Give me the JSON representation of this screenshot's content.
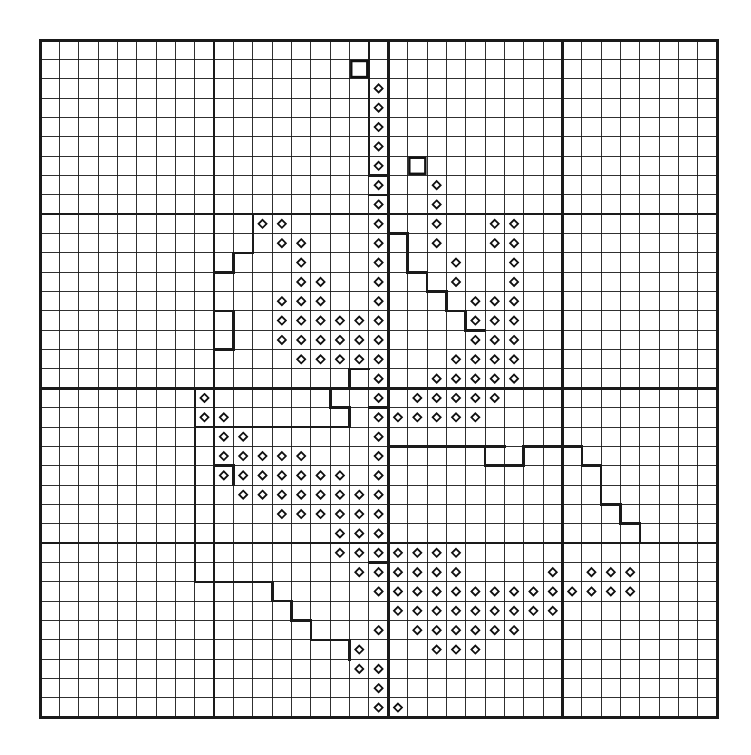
{
  "figure": {
    "type": "grid-map",
    "title": "",
    "background_color": "#ffffff",
    "line_color": "#1a1a1a"
  },
  "grid": {
    "cols": 35,
    "rows": 35,
    "origin_x": 40,
    "origin_y": 40,
    "cell": 19.35,
    "minor_width": 0.9,
    "major_width": 2.6,
    "border_width": 3.0,
    "major_every": 9,
    "major_cols": [
      0,
      9,
      18,
      27,
      35
    ],
    "major_rows": [
      0,
      9,
      18,
      26,
      35
    ]
  },
  "symbols": {
    "diamond": {
      "name": "diamond-marker",
      "size": 8,
      "stroke": "#111111",
      "stroke_width": 1.8,
      "fill": "#ffffff"
    },
    "square": {
      "name": "open-square-marker",
      "size": 16,
      "stroke": "#111111",
      "stroke_width": 2.4,
      "fill": "#ffffff"
    }
  },
  "chart_data": {
    "type": "heatmap",
    "title": "",
    "xlabel": "",
    "ylabel": "",
    "grid": true,
    "legend": "none",
    "axis_ranges": {
      "x": [
        0,
        35
      ],
      "y": [
        0,
        35
      ]
    },
    "marker_legend": [
      {
        "symbol": "diamond",
        "meaning": "recorded-presence"
      },
      {
        "symbol": "square",
        "meaning": "isolated-record"
      }
    ],
    "squares": [
      {
        "col": 16,
        "row": 1
      },
      {
        "col": 19,
        "row": 6
      }
    ],
    "diamonds": [
      {
        "col": 17,
        "row": 2
      },
      {
        "col": 17,
        "row": 3
      },
      {
        "col": 17,
        "row": 4
      },
      {
        "col": 17,
        "row": 5
      },
      {
        "col": 17,
        "row": 6
      },
      {
        "col": 17,
        "row": 7
      },
      {
        "col": 20,
        "row": 7
      },
      {
        "col": 17,
        "row": 8
      },
      {
        "col": 20,
        "row": 8
      },
      {
        "col": 17,
        "row": 9
      },
      {
        "col": 20,
        "row": 9
      },
      {
        "col": 23,
        "row": 9
      },
      {
        "col": 24,
        "row": 9
      },
      {
        "col": 11,
        "row": 9
      },
      {
        "col": 12,
        "row": 9
      },
      {
        "col": 17,
        "row": 10
      },
      {
        "col": 20,
        "row": 10
      },
      {
        "col": 23,
        "row": 10
      },
      {
        "col": 24,
        "row": 10
      },
      {
        "col": 12,
        "row": 10
      },
      {
        "col": 13,
        "row": 10
      },
      {
        "col": 17,
        "row": 11
      },
      {
        "col": 21,
        "row": 11
      },
      {
        "col": 24,
        "row": 11
      },
      {
        "col": 13,
        "row": 11
      },
      {
        "col": 17,
        "row": 12
      },
      {
        "col": 21,
        "row": 12
      },
      {
        "col": 24,
        "row": 12
      },
      {
        "col": 13,
        "row": 12
      },
      {
        "col": 14,
        "row": 12
      },
      {
        "col": 17,
        "row": 13
      },
      {
        "col": 12,
        "row": 13
      },
      {
        "col": 13,
        "row": 13
      },
      {
        "col": 14,
        "row": 13
      },
      {
        "col": 22,
        "row": 13
      },
      {
        "col": 23,
        "row": 13
      },
      {
        "col": 24,
        "row": 13
      },
      {
        "col": 17,
        "row": 14
      },
      {
        "col": 12,
        "row": 14
      },
      {
        "col": 13,
        "row": 14
      },
      {
        "col": 14,
        "row": 14
      },
      {
        "col": 15,
        "row": 14
      },
      {
        "col": 16,
        "row": 14
      },
      {
        "col": 22,
        "row": 14
      },
      {
        "col": 23,
        "row": 14
      },
      {
        "col": 24,
        "row": 14
      },
      {
        "col": 17,
        "row": 15
      },
      {
        "col": 12,
        "row": 15
      },
      {
        "col": 13,
        "row": 15
      },
      {
        "col": 14,
        "row": 15
      },
      {
        "col": 15,
        "row": 15
      },
      {
        "col": 16,
        "row": 15
      },
      {
        "col": 22,
        "row": 15
      },
      {
        "col": 23,
        "row": 15
      },
      {
        "col": 24,
        "row": 15
      },
      {
        "col": 17,
        "row": 16
      },
      {
        "col": 13,
        "row": 16
      },
      {
        "col": 14,
        "row": 16
      },
      {
        "col": 15,
        "row": 16
      },
      {
        "col": 16,
        "row": 16
      },
      {
        "col": 21,
        "row": 16
      },
      {
        "col": 22,
        "row": 16
      },
      {
        "col": 23,
        "row": 16
      },
      {
        "col": 24,
        "row": 16
      },
      {
        "col": 17,
        "row": 17
      },
      {
        "col": 20,
        "row": 17
      },
      {
        "col": 21,
        "row": 17
      },
      {
        "col": 22,
        "row": 17
      },
      {
        "col": 23,
        "row": 17
      },
      {
        "col": 24,
        "row": 17
      },
      {
        "col": 17,
        "row": 18
      },
      {
        "col": 19,
        "row": 18
      },
      {
        "col": 20,
        "row": 18
      },
      {
        "col": 21,
        "row": 18
      },
      {
        "col": 22,
        "row": 18
      },
      {
        "col": 23,
        "row": 18
      },
      {
        "col": 8,
        "row": 18
      },
      {
        "col": 17,
        "row": 19
      },
      {
        "col": 18,
        "row": 19
      },
      {
        "col": 19,
        "row": 19
      },
      {
        "col": 20,
        "row": 19
      },
      {
        "col": 21,
        "row": 19
      },
      {
        "col": 22,
        "row": 19
      },
      {
        "col": 8,
        "row": 19
      },
      {
        "col": 9,
        "row": 19
      },
      {
        "col": 17,
        "row": 20
      },
      {
        "col": 9,
        "row": 20
      },
      {
        "col": 10,
        "row": 20
      },
      {
        "col": 17,
        "row": 21
      },
      {
        "col": 9,
        "row": 21
      },
      {
        "col": 10,
        "row": 21
      },
      {
        "col": 11,
        "row": 21
      },
      {
        "col": 12,
        "row": 21
      },
      {
        "col": 13,
        "row": 21
      },
      {
        "col": 9,
        "row": 22
      },
      {
        "col": 10,
        "row": 22
      },
      {
        "col": 11,
        "row": 22
      },
      {
        "col": 12,
        "row": 22
      },
      {
        "col": 13,
        "row": 22
      },
      {
        "col": 14,
        "row": 22
      },
      {
        "col": 15,
        "row": 22
      },
      {
        "col": 17,
        "row": 22
      },
      {
        "col": 10,
        "row": 23
      },
      {
        "col": 11,
        "row": 23
      },
      {
        "col": 12,
        "row": 23
      },
      {
        "col": 13,
        "row": 23
      },
      {
        "col": 14,
        "row": 23
      },
      {
        "col": 15,
        "row": 23
      },
      {
        "col": 16,
        "row": 23
      },
      {
        "col": 17,
        "row": 23
      },
      {
        "col": 12,
        "row": 24
      },
      {
        "col": 13,
        "row": 24
      },
      {
        "col": 14,
        "row": 24
      },
      {
        "col": 15,
        "row": 24
      },
      {
        "col": 16,
        "row": 24
      },
      {
        "col": 17,
        "row": 24
      },
      {
        "col": 15,
        "row": 25
      },
      {
        "col": 16,
        "row": 25
      },
      {
        "col": 17,
        "row": 25
      },
      {
        "col": 15,
        "row": 26
      },
      {
        "col": 16,
        "row": 26
      },
      {
        "col": 17,
        "row": 26
      },
      {
        "col": 18,
        "row": 26
      },
      {
        "col": 19,
        "row": 26
      },
      {
        "col": 20,
        "row": 26
      },
      {
        "col": 21,
        "row": 26
      },
      {
        "col": 16,
        "row": 27
      },
      {
        "col": 17,
        "row": 27
      },
      {
        "col": 18,
        "row": 27
      },
      {
        "col": 19,
        "row": 27
      },
      {
        "col": 20,
        "row": 27
      },
      {
        "col": 21,
        "row": 27
      },
      {
        "col": 26,
        "row": 27
      },
      {
        "col": 28,
        "row": 27
      },
      {
        "col": 29,
        "row": 27
      },
      {
        "col": 30,
        "row": 27
      },
      {
        "col": 17,
        "row": 28
      },
      {
        "col": 18,
        "row": 28
      },
      {
        "col": 19,
        "row": 28
      },
      {
        "col": 20,
        "row": 28
      },
      {
        "col": 21,
        "row": 28
      },
      {
        "col": 22,
        "row": 28
      },
      {
        "col": 23,
        "row": 28
      },
      {
        "col": 24,
        "row": 28
      },
      {
        "col": 25,
        "row": 28
      },
      {
        "col": 26,
        "row": 28
      },
      {
        "col": 27,
        "row": 28
      },
      {
        "col": 28,
        "row": 28
      },
      {
        "col": 29,
        "row": 28
      },
      {
        "col": 30,
        "row": 28
      },
      {
        "col": 18,
        "row": 29
      },
      {
        "col": 19,
        "row": 29
      },
      {
        "col": 20,
        "row": 29
      },
      {
        "col": 21,
        "row": 29
      },
      {
        "col": 22,
        "row": 29
      },
      {
        "col": 23,
        "row": 29
      },
      {
        "col": 24,
        "row": 29
      },
      {
        "col": 25,
        "row": 29
      },
      {
        "col": 26,
        "row": 29
      },
      {
        "col": 19,
        "row": 30
      },
      {
        "col": 20,
        "row": 30
      },
      {
        "col": 21,
        "row": 30
      },
      {
        "col": 22,
        "row": 30
      },
      {
        "col": 23,
        "row": 30
      },
      {
        "col": 24,
        "row": 30
      },
      {
        "col": 17,
        "row": 30
      },
      {
        "col": 20,
        "row": 31
      },
      {
        "col": 21,
        "row": 31
      },
      {
        "col": 22,
        "row": 31
      },
      {
        "col": 16,
        "row": 31
      },
      {
        "col": 16,
        "row": 32
      },
      {
        "col": 17,
        "row": 32
      },
      {
        "col": 17,
        "row": 33
      },
      {
        "col": 17,
        "row": 34
      },
      {
        "col": 18,
        "row": 34
      }
    ],
    "boundaries": [
      {
        "name": "north-central-region",
        "path": "M 17,0 L 17,7 L 18,7 L 18,9 L 19,9 L 19,12 L 20,12 L 20,13 L 21,13 L 21,14 L 22,14 L 22,15 L 23,15 L 23,13 L 21,13 L 21,12 L 20,12 L 20,11 L 19,11"
      },
      {
        "name": "west-central-region",
        "path": "M 9,9 L 9,14 L 10,14 L 10,16 L 9,16 L 9,18 L 8,18 L 8,21"
      }
    ],
    "polylines": [
      [
        [
          17,
          0
        ],
        [
          17,
          7
        ],
        [
          18,
          7
        ],
        [
          18,
          8
        ],
        [
          17,
          8
        ]
      ],
      [
        [
          9,
          9
        ],
        [
          9,
          14
        ],
        [
          10,
          14
        ],
        [
          10,
          16
        ],
        [
          9,
          16
        ],
        [
          9,
          18
        ],
        [
          8,
          18
        ],
        [
          8,
          21
        ]
      ],
      [
        [
          11,
          9
        ],
        [
          11,
          11
        ],
        [
          10,
          11
        ],
        [
          10,
          12
        ],
        [
          9,
          12
        ]
      ],
      [
        [
          18,
          9
        ],
        [
          18,
          10
        ],
        [
          19,
          10
        ],
        [
          19,
          12
        ],
        [
          20,
          12
        ],
        [
          20,
          13
        ],
        [
          21,
          13
        ],
        [
          21,
          14
        ],
        [
          22,
          14
        ],
        [
          22,
          15
        ],
        [
          23,
          15
        ]
      ],
      [
        [
          17,
          17
        ],
        [
          16,
          17
        ],
        [
          16,
          18
        ],
        [
          15,
          18
        ],
        [
          15,
          19
        ],
        [
          16,
          19
        ]
      ],
      [
        [
          8,
          18
        ],
        [
          8,
          20
        ],
        [
          9,
          20
        ],
        [
          9,
          22
        ],
        [
          10,
          22
        ],
        [
          10,
          23
        ]
      ],
      [
        [
          17,
          18
        ],
        [
          18,
          18
        ],
        [
          18,
          19
        ],
        [
          17,
          19
        ]
      ],
      [
        [
          16,
          19
        ],
        [
          16,
          20
        ],
        [
          9,
          20
        ]
      ],
      [
        [
          24,
          22
        ],
        [
          25,
          22
        ],
        [
          25,
          21
        ],
        [
          28,
          21
        ],
        [
          28,
          22
        ],
        [
          29,
          22
        ],
        [
          29,
          24
        ],
        [
          30,
          24
        ],
        [
          30,
          25
        ],
        [
          31,
          25
        ],
        [
          31,
          26
        ]
      ],
      [
        [
          8,
          20
        ],
        [
          8,
          28
        ],
        [
          12,
          28
        ],
        [
          12,
          29
        ],
        [
          13,
          29
        ],
        [
          13,
          30
        ],
        [
          14,
          30
        ],
        [
          14,
          31
        ],
        [
          16,
          31
        ],
        [
          16,
          32
        ]
      ],
      [
        [
          23,
          21
        ],
        [
          23,
          22
        ],
        [
          24,
          22
        ]
      ],
      [
        [
          18,
          26
        ],
        [
          18,
          27
        ],
        [
          17,
          27
        ]
      ],
      [
        [
          31,
          26
        ],
        [
          35,
          26
        ]
      ],
      [
        [
          0,
          26
        ],
        [
          16,
          26
        ]
      ],
      [
        [
          18,
          21
        ],
        [
          24,
          21
        ]
      ]
    ]
  }
}
